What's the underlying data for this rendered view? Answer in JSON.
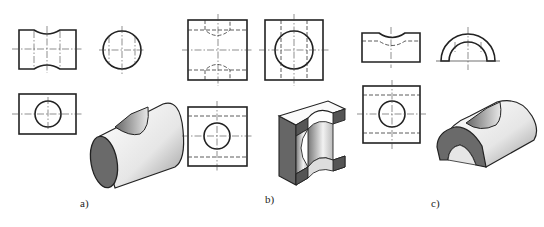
{
  "figure": {
    "panels": [
      {
        "id": "a",
        "label": "a)",
        "part": "solid cylinder with cross hole"
      },
      {
        "id": "b",
        "label": "b)",
        "part": "square block with through hole (cut section)"
      },
      {
        "id": "c",
        "label": "c)",
        "part": "half-cylinder shell with hole"
      }
    ]
  },
  "colors": {
    "line": "#222222",
    "shade_dark": "#555555",
    "shade_light": "#f2f2f2"
  }
}
